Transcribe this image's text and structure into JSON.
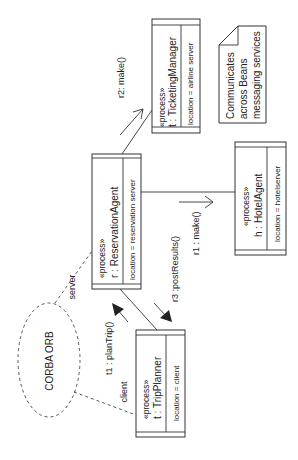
{
  "diagram": {
    "type": "UML collaboration diagram (rotated)",
    "objects": [
      {
        "id": "ticketing",
        "stereotype": "«process»",
        "name": "t : TicketingManager",
        "attribute": "location = airline server"
      },
      {
        "id": "reservation",
        "stereotype": "«process»",
        "name": "r :  ReservationAgent",
        "attribute": "location = reservation server"
      },
      {
        "id": "hotel",
        "stereotype": "«process»",
        "name": "h :  HotelAgent",
        "attribute": "location = hotelserver"
      },
      {
        "id": "trip",
        "stereotype": "«process»",
        "name": "t :  TripPlanner",
        "attribute": "location = client"
      }
    ],
    "messages": {
      "r2": "r2: make()",
      "r1": "r1 : make()",
      "r3": "r3 :postResults()",
      "t1": "t1 : planTrip()"
    },
    "orb": {
      "label": "CORBA ORB",
      "server_label": "server",
      "client_label": "client"
    },
    "note": {
      "lines": [
        "Communicates",
        "across Beans",
        "messaging services"
      ]
    }
  }
}
